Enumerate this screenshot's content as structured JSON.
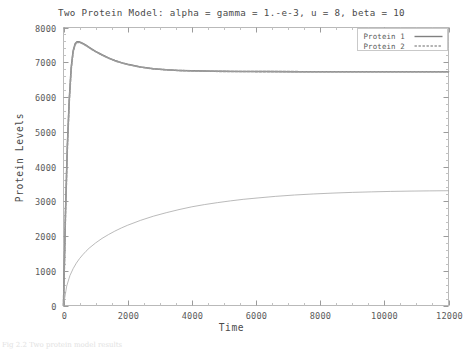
{
  "chart_data": {
    "type": "line",
    "title": "Two Protein Model: alpha = gamma = 1.-e-3, u = 8, beta = 10",
    "xlabel": "Time",
    "ylabel": "Protein Levels",
    "xlim": [
      0,
      12000
    ],
    "ylim": [
      0,
      8000
    ],
    "xticks": [
      0,
      2000,
      4000,
      6000,
      8000,
      10000,
      12000
    ],
    "xtick_labels": [
      "0",
      "2000",
      "4000",
      "6000",
      "8000",
      "10000",
      "12000"
    ],
    "yticks": [
      0,
      1000,
      2000,
      3000,
      4000,
      5000,
      6000,
      7000,
      8000
    ],
    "ytick_labels": [
      "0",
      "1000",
      "2000",
      "3000",
      "4000",
      "5000",
      "6000",
      "7000",
      "8000"
    ],
    "minor_ticks": true,
    "grid": false,
    "legend_position": "top-right",
    "series": [
      {
        "name": "Protein 1",
        "style": "solid",
        "color": "#808080",
        "x": [
          0,
          60,
          120,
          180,
          240,
          300,
          360,
          420,
          480,
          540,
          600,
          700,
          800,
          900,
          1000,
          1200,
          1400,
          1600,
          1800,
          2000,
          2400,
          2800,
          3200,
          3600,
          4000,
          4800,
          5600,
          6400,
          7200,
          8000,
          9000,
          10000,
          11000,
          12000
        ],
        "y": [
          0,
          2600,
          4600,
          5950,
          6850,
          7330,
          7530,
          7590,
          7590,
          7570,
          7545,
          7490,
          7430,
          7370,
          7315,
          7215,
          7125,
          7050,
          6990,
          6940,
          6865,
          6815,
          6785,
          6765,
          6752,
          6740,
          6735,
          6732,
          6730,
          6729,
          6728,
          6728,
          6727,
          6727
        ]
      },
      {
        "name": "Protein 2",
        "style": "dashed",
        "color": "#9a9a9a",
        "x": [
          0,
          60,
          120,
          180,
          240,
          300,
          360,
          420,
          480,
          540,
          600,
          700,
          800,
          900,
          1000,
          1200,
          1400,
          1600,
          1800,
          2000,
          2400,
          2800,
          3200,
          3600,
          4000,
          4800,
          5600,
          6400,
          7200,
          8000,
          9000,
          10000,
          11000,
          12000
        ],
        "y": [
          0,
          2520,
          4520,
          5880,
          6800,
          7290,
          7500,
          7570,
          7575,
          7560,
          7535,
          7480,
          7420,
          7360,
          7305,
          7205,
          7118,
          7044,
          6984,
          6934,
          6860,
          6810,
          6782,
          6762,
          6750,
          6738,
          6733,
          6730,
          6729,
          6728,
          6727,
          6727,
          6726,
          6726
        ]
      },
      {
        "name": "Protein 2 lower branch",
        "style": "solid",
        "color": "#a8a8a8",
        "x": [
          0,
          100,
          200,
          300,
          400,
          500,
          600,
          700,
          800,
          1000,
          1200,
          1400,
          1600,
          1800,
          2000,
          2400,
          2800,
          3200,
          3600,
          4000,
          4400,
          4800,
          5200,
          5600,
          6000,
          6600,
          7200,
          7800,
          8400,
          9000,
          9600,
          10200,
          10800,
          11400,
          12000
        ],
        "y": [
          0,
          560,
          860,
          1060,
          1220,
          1350,
          1460,
          1560,
          1650,
          1800,
          1930,
          2040,
          2140,
          2230,
          2310,
          2450,
          2570,
          2670,
          2760,
          2840,
          2905,
          2960,
          3010,
          3055,
          3090,
          3140,
          3180,
          3210,
          3235,
          3255,
          3270,
          3283,
          3292,
          3298,
          3303
        ]
      }
    ],
    "legend_entries": [
      {
        "label": "Protein 1",
        "style": "solid"
      },
      {
        "label": "Protein 2",
        "style": "dashed"
      }
    ]
  },
  "caption": {
    "text": "Fig 2.2 Two protein model results"
  }
}
